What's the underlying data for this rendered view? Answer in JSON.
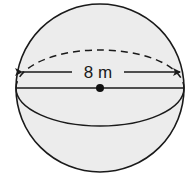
{
  "figure": {
    "type": "sphere",
    "dimension_label": "8 m",
    "dimension_kind": "diameter",
    "colors": {
      "background": "#ffffff",
      "sphere_fill": "#ececec",
      "stroke": "#1a1a1a"
    }
  }
}
